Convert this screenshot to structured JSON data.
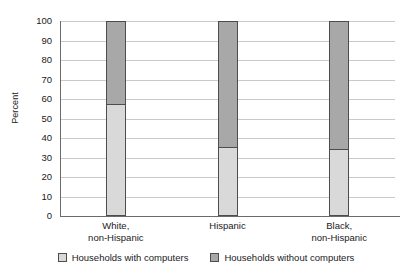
{
  "chart_data": {
    "type": "bar",
    "subtype": "stacked-100-percent",
    "title": "",
    "xlabel": "",
    "ylabel": "Percent",
    "ylim": [
      0,
      100
    ],
    "yticks": [
      100,
      90,
      80,
      70,
      60,
      50,
      40,
      30,
      20,
      10,
      0
    ],
    "grid": true,
    "legend_position": "bottom",
    "categories": [
      "White,\nnon-Hispanic",
      "Hispanic",
      "Black,\nnon-Hispanic"
    ],
    "category_lines": [
      [
        "White,",
        "non-Hispanic"
      ],
      [
        "Hispanic",
        ""
      ],
      [
        "Black,",
        "non-Hispanic"
      ]
    ],
    "series": [
      {
        "name": "Households with computers",
        "color": "#d9d9d9",
        "values": [
          57,
          35,
          34
        ]
      },
      {
        "name": "Households without computers",
        "color": "#a8a8a8",
        "values": [
          43,
          65,
          66
        ]
      }
    ]
  },
  "legend": {
    "items": [
      {
        "label": "Households with computers",
        "color": "#d9d9d9"
      },
      {
        "label": "Households without computers",
        "color": "#a8a8a8"
      }
    ]
  },
  "colors": {
    "with_computers": "#d9d9d9",
    "without_computers": "#a8a8a8",
    "gridline": "#c9c9c9",
    "axis": "#6b6b6b",
    "bar_outline": "#4d4d4d",
    "text": "#1a1a1a",
    "background": "#ffffff"
  }
}
